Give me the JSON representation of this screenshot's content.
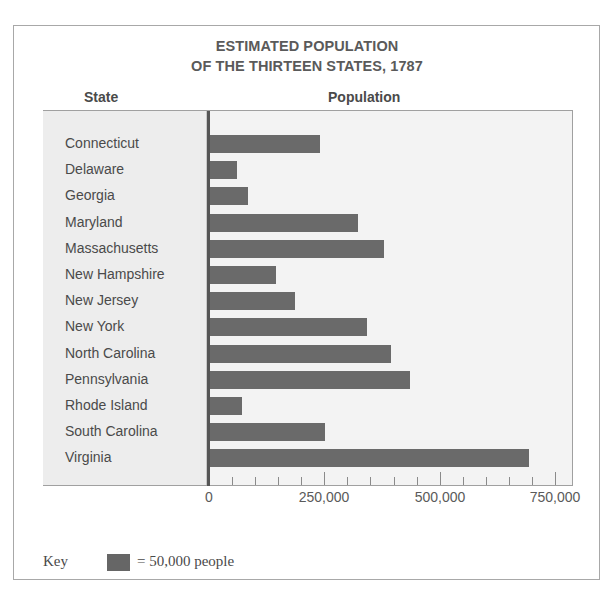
{
  "title": {
    "line1": "ESTIMATED POPULATION",
    "line2": "OF THE THIRTEEN STATES, 1787"
  },
  "columns": {
    "state": "State",
    "population": "Population"
  },
  "axis": {
    "ticks": [
      "0",
      "250,000",
      "500,000",
      "750,000"
    ]
  },
  "key": {
    "label": "Key",
    "text": "= 50,000 people"
  },
  "colors": {
    "bar": "#6a6a6a",
    "panel": "#f3f3f3",
    "text": "#4a4a4a"
  },
  "chart_data": {
    "type": "bar",
    "orientation": "horizontal",
    "title": "ESTIMATED POPULATION OF THE THIRTEEN STATES, 1787",
    "xlabel": "Population",
    "ylabel": "State",
    "categories": [
      "Connecticut",
      "Delaware",
      "Georgia",
      "Maryland",
      "Massachusetts",
      "New Hampshire",
      "New Jersey",
      "New York",
      "North Carolina",
      "Pennsylvania",
      "Rhode Island",
      "South Carolina",
      "Virginia"
    ],
    "values": [
      238000,
      59000,
      82000,
      320000,
      378000,
      142000,
      184000,
      340000,
      393000,
      434000,
      69000,
      249000,
      692000
    ],
    "xlim": [
      0,
      750000
    ],
    "x_ticks": [
      0,
      250000,
      500000,
      750000
    ],
    "minor_tick_interval": 50000,
    "grid": false,
    "legend": {
      "position": "bottom-left",
      "entries": [
        "= 50,000 people"
      ]
    }
  }
}
